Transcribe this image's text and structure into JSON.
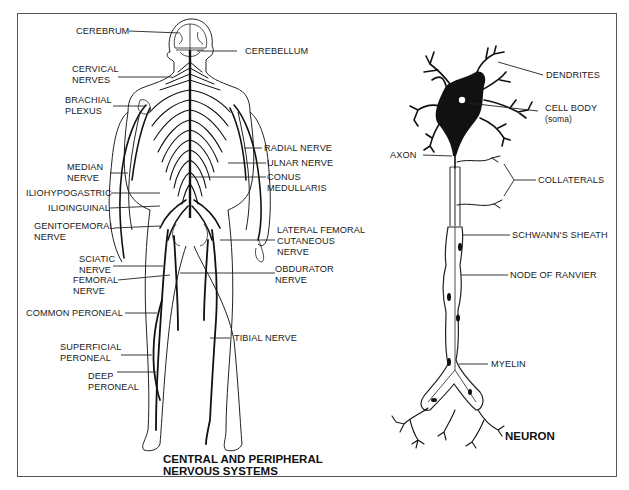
{
  "diagram": {
    "left_title": [
      "CENTRAL AND PERIPHERAL",
      "NERVOUS SYSTEMS"
    ],
    "right_title": "NEURON",
    "body_labels": {
      "cerebrum": "CEREBRUM",
      "cerebellum": "CEREBELLUM",
      "cervical_nerves": [
        "CERVICAL",
        "NERVES"
      ],
      "brachial_plexus": [
        "BRACHIAL",
        "PLEXUS"
      ],
      "radial_nerve": "RADIAL NERVE",
      "ulnar_nerve": "ULNAR NERVE",
      "median_nerve": [
        "MEDIAN",
        "NERVE"
      ],
      "conus_medullaris": [
        "CONUS",
        "MEDULLARIS"
      ],
      "iliohypogastric": "ILIOHYPOGASTRIC",
      "ilioinguinal": "ILIOINGUINAL",
      "genitofemoral_nerve": [
        "GENITOFEMORAL",
        "NERVE"
      ],
      "lateral_femoral_cutaneous_nerve": [
        "LATERAL FEMORAL",
        "CUTANEOUS",
        "NERVE"
      ],
      "sciatic_nerve": [
        "SCIATIC",
        "NERVE"
      ],
      "obdurator_nerve": [
        "OBDURATOR",
        "NERVE"
      ],
      "femoral_nerve": [
        "FEMORAL",
        "NERVE"
      ],
      "common_peroneal": "COMMON PERONEAL",
      "tibial_nerve": "TIBIAL NERVE",
      "superficial_peroneal": [
        "SUPERFICIAL",
        "PERONEAL"
      ],
      "deep_peroneal": [
        "DEEP",
        "PERONEAL"
      ]
    },
    "neuron_labels": {
      "dendrites": "DENDRITES",
      "cell_body": "CELL BODY",
      "cell_body_sub": "(soma)",
      "axon": "AXON",
      "collaterals": "COLLATERALS",
      "schwanns_sheath": "SCHWANN'S SHEATH",
      "node_of_ranvier": "NODE OF RANVIER",
      "myelin": "MYELIN"
    }
  }
}
